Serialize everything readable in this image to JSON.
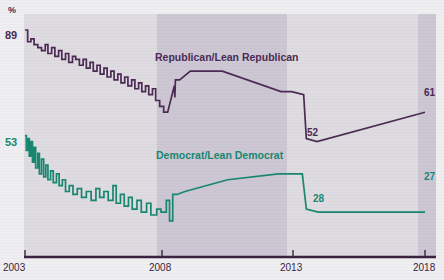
{
  "chart_data": {
    "type": "line",
    "title": "",
    "subtitle": "",
    "xlabel": "",
    "ylabel": "%",
    "unit_symbol": "%",
    "grid": false,
    "legend_position": "inline-annotation",
    "xlim": [
      2003,
      2018
    ],
    "ylim": [
      20,
      95
    ],
    "xticks": [
      "2003",
      "2008",
      "2013",
      "2018"
    ],
    "annotations": [
      {
        "name": "rep-start",
        "text": "89",
        "series": "Republican/Lean Republican",
        "x": 2003,
        "y": 89
      },
      {
        "name": "dem-start",
        "text": "53",
        "series": "Democrat/Lean Democrat",
        "x": 2003,
        "y": 53
      },
      {
        "name": "rep-dip",
        "text": "52",
        "series": "Republican/Lean Republican",
        "x": 2013.6,
        "y": 52
      },
      {
        "name": "dem-dip",
        "text": "28",
        "series": "Democrat/Lean Democrat",
        "x": 2013.6,
        "y": 28
      },
      {
        "name": "rep-end",
        "text": "61",
        "series": "Republican/Lean Republican",
        "x": 2018,
        "y": 61
      },
      {
        "name": "dem-end",
        "text": "27",
        "series": "Democrat/Lean Democrat",
        "x": 2018,
        "y": 27
      }
    ],
    "shaded_bands": [
      {
        "name": "mid-band",
        "from": 2007.9,
        "to": 2012.8
      },
      {
        "name": "right-band",
        "from": 2017.5,
        "to": 2018.2
      }
    ],
    "series": [
      {
        "name": "Republican/Lean Republican",
        "label": "Republican/Lean Republican",
        "color": "#4a2a52",
        "points": [
          [
            2003.0,
            89
          ],
          [
            2003.1,
            89
          ],
          [
            2003.1,
            85
          ],
          [
            2003.22,
            85
          ],
          [
            2003.22,
            86
          ],
          [
            2003.34,
            86
          ],
          [
            2003.34,
            84
          ],
          [
            2003.48,
            84
          ],
          [
            2003.48,
            83
          ],
          [
            2003.62,
            83
          ],
          [
            2003.62,
            82
          ],
          [
            2003.76,
            82
          ],
          [
            2003.76,
            84
          ],
          [
            2003.86,
            84
          ],
          [
            2003.86,
            81
          ],
          [
            2004.0,
            81
          ],
          [
            2004.0,
            83
          ],
          [
            2004.12,
            83
          ],
          [
            2004.12,
            80
          ],
          [
            2004.26,
            80
          ],
          [
            2004.26,
            82
          ],
          [
            2004.38,
            82
          ],
          [
            2004.38,
            79
          ],
          [
            2004.52,
            79
          ],
          [
            2004.52,
            81
          ],
          [
            2004.64,
            81
          ],
          [
            2004.64,
            78
          ],
          [
            2004.78,
            78
          ],
          [
            2004.78,
            80
          ],
          [
            2004.9,
            80
          ],
          [
            2004.9,
            79
          ],
          [
            2005.04,
            79
          ],
          [
            2005.04,
            77
          ],
          [
            2005.18,
            77
          ],
          [
            2005.18,
            79
          ],
          [
            2005.3,
            79
          ],
          [
            2005.3,
            76
          ],
          [
            2005.44,
            76
          ],
          [
            2005.44,
            78
          ],
          [
            2005.56,
            78
          ],
          [
            2005.56,
            75
          ],
          [
            2005.7,
            75
          ],
          [
            2005.7,
            77
          ],
          [
            2005.82,
            77
          ],
          [
            2005.82,
            74
          ],
          [
            2005.96,
            74
          ],
          [
            2005.96,
            76
          ],
          [
            2006.08,
            76
          ],
          [
            2006.08,
            73
          ],
          [
            2006.22,
            73
          ],
          [
            2006.22,
            75
          ],
          [
            2006.34,
            75
          ],
          [
            2006.34,
            72
          ],
          [
            2006.48,
            72
          ],
          [
            2006.48,
            74
          ],
          [
            2006.6,
            74
          ],
          [
            2006.6,
            71
          ],
          [
            2006.74,
            71
          ],
          [
            2006.74,
            73
          ],
          [
            2006.86,
            73
          ],
          [
            2006.86,
            70
          ],
          [
            2007.0,
            70
          ],
          [
            2007.0,
            72
          ],
          [
            2007.12,
            72
          ],
          [
            2007.12,
            69
          ],
          [
            2007.26,
            69
          ],
          [
            2007.26,
            71
          ],
          [
            2007.38,
            71
          ],
          [
            2007.38,
            68
          ],
          [
            2007.52,
            68
          ],
          [
            2007.52,
            70
          ],
          [
            2007.64,
            70
          ],
          [
            2007.64,
            67
          ],
          [
            2007.78,
            67
          ],
          [
            2007.78,
            69
          ],
          [
            2007.9,
            69
          ],
          [
            2007.9,
            65
          ],
          [
            2008.05,
            65
          ],
          [
            2008.05,
            63
          ],
          [
            2008.2,
            63
          ],
          [
            2008.2,
            61
          ],
          [
            2008.35,
            61
          ],
          [
            2008.6,
            70
          ],
          [
            2008.62,
            66
          ],
          [
            2008.64,
            72
          ],
          [
            2008.8,
            72
          ],
          [
            2009.2,
            75
          ],
          [
            2010.4,
            75
          ],
          [
            2012.6,
            68
          ],
          [
            2013.0,
            68
          ],
          [
            2013.45,
            67
          ],
          [
            2013.55,
            52
          ],
          [
            2013.95,
            51
          ],
          [
            2018.0,
            61
          ]
        ]
      },
      {
        "name": "Democrat/Lean Democrat",
        "label": "Democrat/Lean Democrat",
        "color": "#17876f",
        "points": [
          [
            2003.0,
            53
          ],
          [
            2003.05,
            53
          ],
          [
            2003.05,
            48
          ],
          [
            2003.1,
            48
          ],
          [
            2003.1,
            52
          ],
          [
            2003.16,
            52
          ],
          [
            2003.16,
            46
          ],
          [
            2003.22,
            46
          ],
          [
            2003.22,
            51
          ],
          [
            2003.28,
            51
          ],
          [
            2003.28,
            44
          ],
          [
            2003.34,
            44
          ],
          [
            2003.34,
            49
          ],
          [
            2003.4,
            49
          ],
          [
            2003.4,
            42
          ],
          [
            2003.48,
            42
          ],
          [
            2003.48,
            47
          ],
          [
            2003.54,
            47
          ],
          [
            2003.54,
            40
          ],
          [
            2003.62,
            40
          ],
          [
            2003.62,
            45
          ],
          [
            2003.7,
            45
          ],
          [
            2003.7,
            39
          ],
          [
            2003.78,
            39
          ],
          [
            2003.78,
            43
          ],
          [
            2003.86,
            43
          ],
          [
            2003.86,
            38
          ],
          [
            2003.96,
            38
          ],
          [
            2003.96,
            41
          ],
          [
            2004.06,
            41
          ],
          [
            2004.06,
            37
          ],
          [
            2004.18,
            37
          ],
          [
            2004.18,
            40
          ],
          [
            2004.28,
            40
          ],
          [
            2004.28,
            36
          ],
          [
            2004.4,
            36
          ],
          [
            2004.4,
            38
          ],
          [
            2004.52,
            38
          ],
          [
            2004.52,
            34
          ],
          [
            2004.66,
            34
          ],
          [
            2004.66,
            36
          ],
          [
            2004.8,
            36
          ],
          [
            2004.8,
            33
          ],
          [
            2004.96,
            33
          ],
          [
            2004.96,
            35
          ],
          [
            2005.12,
            35
          ],
          [
            2005.12,
            32
          ],
          [
            2005.3,
            32
          ],
          [
            2005.3,
            34
          ],
          [
            2005.48,
            34
          ],
          [
            2005.48,
            31
          ],
          [
            2005.66,
            31
          ],
          [
            2005.66,
            35
          ],
          [
            2005.8,
            35
          ],
          [
            2005.8,
            32
          ],
          [
            2005.96,
            32
          ],
          [
            2005.96,
            34
          ],
          [
            2006.12,
            34
          ],
          [
            2006.12,
            31
          ],
          [
            2006.3,
            31
          ],
          [
            2006.3,
            36
          ],
          [
            2006.42,
            36
          ],
          [
            2006.42,
            30
          ],
          [
            2006.58,
            30
          ],
          [
            2006.58,
            33
          ],
          [
            2006.72,
            33
          ],
          [
            2006.72,
            29
          ],
          [
            2006.88,
            29
          ],
          [
            2006.88,
            32
          ],
          [
            2007.02,
            32
          ],
          [
            2007.02,
            28
          ],
          [
            2007.2,
            28
          ],
          [
            2007.2,
            31
          ],
          [
            2007.36,
            31
          ],
          [
            2007.36,
            27
          ],
          [
            2007.56,
            27
          ],
          [
            2007.56,
            30
          ],
          [
            2007.72,
            30
          ],
          [
            2007.72,
            26
          ],
          [
            2007.94,
            26
          ],
          [
            2007.94,
            28
          ],
          [
            2008.1,
            28
          ],
          [
            2008.1,
            27
          ],
          [
            2008.3,
            27
          ],
          [
            2008.3,
            31
          ],
          [
            2008.42,
            31
          ],
          [
            2008.42,
            24
          ],
          [
            2008.54,
            24
          ],
          [
            2008.54,
            33
          ],
          [
            2008.7,
            33
          ],
          [
            2009.0,
            34
          ],
          [
            2010.6,
            38
          ],
          [
            2012.5,
            40
          ],
          [
            2013.4,
            40
          ],
          [
            2013.55,
            28
          ],
          [
            2014.0,
            27
          ],
          [
            2018.0,
            27
          ]
        ]
      }
    ]
  },
  "axis": {
    "y_unit": "%",
    "x_tick_labels": [
      "2003",
      "2008",
      "2013",
      "2018"
    ]
  },
  "colors": {
    "republican": "#4a2a52",
    "democrat": "#17876f",
    "axis": "#3b2340",
    "plot_background": "#dedbe1",
    "band_background": "#cdc7d4",
    "page_background": "#efeef1"
  }
}
